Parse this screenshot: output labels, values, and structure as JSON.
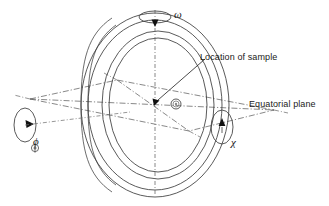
{
  "figure": {
    "kind": "goniometer-geometry-diagram",
    "background_color": "#ffffff",
    "line_color": "#3c3c3c",
    "text_color": "#1a1a1a",
    "width": 329,
    "height": 206
  },
  "labels": {
    "omega": "ω",
    "phi": "ϕ",
    "chi": "χ",
    "sample": "Location of sample",
    "equatorial_plane": "Equatorial plane"
  },
  "icons": {
    "omega_rotation": "omega-rotation-arrow-icon",
    "phi_rotation": "phi-rotation-arrow-icon",
    "chi_rotation": "chi-rotation-arrow-icon",
    "sample_marker": "sample-marker-icon",
    "leader_arrow": "leader-arrowhead-icon"
  },
  "geometry": {
    "center": {
      "x": 155,
      "y": 105
    },
    "vertical_axis": {
      "x": 155,
      "y_top": 10,
      "y_bottom": 196
    },
    "ring_outer": {
      "cx": 155,
      "cy": 105,
      "rx": 74,
      "ry": 92
    },
    "ring_inner": {
      "cx": 155,
      "cy": 105,
      "rx": 56,
      "ry": 74
    },
    "omega_ellipse": {
      "cx": 155,
      "cy": 17,
      "rx": 16,
      "ry": 6
    },
    "phi_ellipse": {
      "cx": 25,
      "cy": 125,
      "rx": 11,
      "ry": 17
    },
    "chi_ellipse": {
      "cx": 222,
      "cy": 127,
      "rx": 11,
      "ry": 17
    },
    "sample_marker": {
      "cx": 176,
      "cy": 104,
      "r_outer": 5,
      "r_inner": 3
    },
    "equatorial_parallelogram": [
      {
        "x": 30,
        "y": 99
      },
      {
        "x": 117,
        "y": 80
      },
      {
        "x": 274,
        "y": 110
      },
      {
        "x": 189,
        "y": 131
      }
    ],
    "sample_leader_line": {
      "x1": 205,
      "y1": 59,
      "x2": 157,
      "y2": 101
    }
  }
}
